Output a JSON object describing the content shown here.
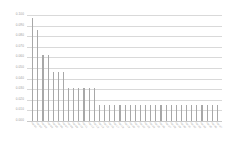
{
  "chart_data": {
    "type": "bar",
    "title": "",
    "subtitle": "",
    "xlabel": "",
    "ylabel": "",
    "ylim": [
      0.0,
      0.1
    ],
    "ytick_labels": [
      "0.100",
      "0.090",
      "0.080",
      "0.070",
      "0.060",
      "0.050",
      "0.040",
      "0.030",
      "0.020",
      "0.010",
      "0.000"
    ],
    "ytick_values": [
      0.1,
      0.09,
      0.08,
      0.07,
      0.06,
      0.05,
      0.04,
      0.03,
      0.02,
      0.01,
      0.0
    ],
    "grid": true,
    "legend": false,
    "legend_position": "none",
    "bar_color": "#a8a8a8",
    "grid_color": "#d9d9d9",
    "axis_label_color": "#9a9a9a",
    "categories": [
      "cat-01",
      "cat-02",
      "cat-03",
      "cat-04",
      "cat-05",
      "cat-06",
      "cat-07",
      "cat-08",
      "cat-09",
      "cat-10",
      "cat-11",
      "cat-12",
      "cat-13",
      "cat-14",
      "cat-15",
      "cat-16",
      "cat-17",
      "cat-18",
      "cat-19",
      "cat-20",
      "cat-21",
      "cat-22",
      "cat-23",
      "cat-24",
      "cat-25",
      "cat-26",
      "cat-27",
      "cat-28",
      "cat-29",
      "cat-30",
      "cat-31",
      "cat-32",
      "cat-33",
      "cat-34",
      "cat-35",
      "cat-36",
      "cat-37"
    ],
    "values": [
      0.097,
      0.086,
      0.062,
      0.062,
      0.046,
      0.046,
      0.046,
      0.031,
      0.031,
      0.031,
      0.031,
      0.031,
      0.031,
      0.015,
      0.015,
      0.015,
      0.015,
      0.015,
      0.015,
      0.015,
      0.015,
      0.015,
      0.015,
      0.015,
      0.015,
      0.015,
      0.015,
      0.015,
      0.015,
      0.015,
      0.015,
      0.015,
      0.015,
      0.015,
      0.015,
      0.015,
      0.015
    ]
  }
}
